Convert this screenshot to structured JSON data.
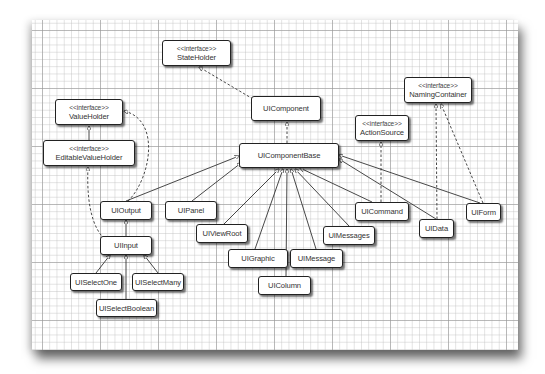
{
  "diagram": {
    "type": "UML class diagram",
    "stereotype_label": "<<interface>>",
    "nodes": {
      "stateHolder": {
        "stereotype": "<<interface>>",
        "name": "StateHolder"
      },
      "uiComponent": {
        "name": "UIComponent"
      },
      "uiComponentBase": {
        "name": "UIComponentBase"
      },
      "valueHolder": {
        "stereotype": "<<interface>>",
        "name": "ValueHolder"
      },
      "editableValueHolder": {
        "stereotype": "<<interface>>",
        "name": "EditableValueHolder"
      },
      "namingContainer": {
        "stereotype": "<<interface>>",
        "name": "NamingContainer"
      },
      "actionSource": {
        "stereotype": "<<interface>>",
        "name": "ActionSource"
      },
      "uiOutput": {
        "name": "UIOutput"
      },
      "uiPanel": {
        "name": "UIPanel"
      },
      "uiViewRoot": {
        "name": "UIViewRoot"
      },
      "uiInput": {
        "name": "UIInput"
      },
      "uiGraphic": {
        "name": "UIGraphic"
      },
      "uiSelectOne": {
        "name": "UISelectOne"
      },
      "uiSelectMany": {
        "name": "UISelectMany"
      },
      "uiSelectBoolean": {
        "name": "UISelectBoolean"
      },
      "uiMessages": {
        "name": "UIMessages"
      },
      "uiMessage": {
        "name": "UIMessage"
      },
      "uiColumn": {
        "name": "UIColumn"
      },
      "uiCommand": {
        "name": "UICommand"
      },
      "uiData": {
        "name": "UIData"
      },
      "uiForm": {
        "name": "UIForm"
      }
    },
    "edges": [
      {
        "from": "UIComponent",
        "to": "StateHolder",
        "kind": "realization"
      },
      {
        "from": "UIComponentBase",
        "to": "UIComponent",
        "kind": "realization"
      },
      {
        "from": "UIOutput",
        "to": "UIComponentBase",
        "kind": "generalization"
      },
      {
        "from": "UIPanel",
        "to": "UIComponentBase",
        "kind": "generalization"
      },
      {
        "from": "UIViewRoot",
        "to": "UIComponentBase",
        "kind": "generalization"
      },
      {
        "from": "UIGraphic",
        "to": "UIComponentBase",
        "kind": "generalization"
      },
      {
        "from": "UIColumn",
        "to": "UIComponentBase",
        "kind": "generalization"
      },
      {
        "from": "UIMessage",
        "to": "UIComponentBase",
        "kind": "generalization"
      },
      {
        "from": "UIMessages",
        "to": "UIComponentBase",
        "kind": "generalization"
      },
      {
        "from": "UICommand",
        "to": "UIComponentBase",
        "kind": "generalization"
      },
      {
        "from": "UIData",
        "to": "UIComponentBase",
        "kind": "generalization"
      },
      {
        "from": "UIForm",
        "to": "UIComponentBase",
        "kind": "generalization"
      },
      {
        "from": "UIOutput",
        "to": "ValueHolder",
        "kind": "realization"
      },
      {
        "from": "EditableValueHolder",
        "to": "ValueHolder",
        "kind": "generalization"
      },
      {
        "from": "UIInput",
        "to": "EditableValueHolder",
        "kind": "realization"
      },
      {
        "from": "UIInput",
        "to": "UIOutput",
        "kind": "generalization"
      },
      {
        "from": "UISelectOne",
        "to": "UIInput",
        "kind": "generalization"
      },
      {
        "from": "UISelectMany",
        "to": "UIInput",
        "kind": "generalization"
      },
      {
        "from": "UISelectBoolean",
        "to": "UIInput",
        "kind": "generalization"
      },
      {
        "from": "UICommand",
        "to": "ActionSource",
        "kind": "realization"
      },
      {
        "from": "UIData",
        "to": "NamingContainer",
        "kind": "realization"
      },
      {
        "from": "UIForm",
        "to": "NamingContainer",
        "kind": "realization"
      }
    ]
  },
  "colors": {
    "line": "#333333",
    "box_border": "#222222",
    "text": "#333333",
    "grid_major": "#969696",
    "grid_minor": "#bebebe"
  }
}
